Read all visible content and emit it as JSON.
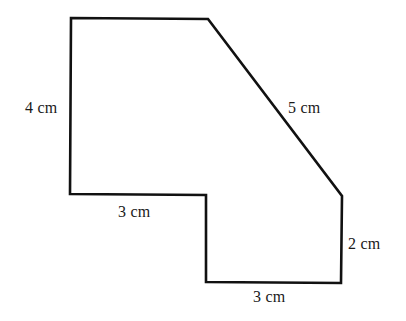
{
  "figure": {
    "shape": "composite-polygon",
    "stroke_color": "#111111",
    "fill_color": "#ffffff",
    "vertices": [
      [
        71,
        18
      ],
      [
        208,
        19
      ],
      [
        342,
        196
      ],
      [
        341,
        283
      ],
      [
        206,
        282
      ],
      [
        206,
        195
      ],
      [
        70,
        194
      ]
    ]
  },
  "labels": {
    "left_side": "4 cm",
    "diagonal_side": "5 cm",
    "step_bottom": "3 cm",
    "right_side": "2 cm",
    "bottom_side": "3 cm"
  }
}
